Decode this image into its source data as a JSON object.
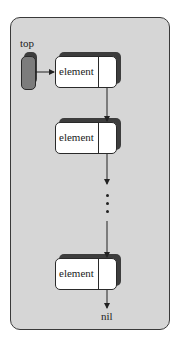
{
  "diagram": {
    "top_label": "top",
    "element_label": "element",
    "nodes": [
      {
        "label": "element"
      },
      {
        "label": "element"
      },
      {
        "label": "element"
      }
    ],
    "terminal_label": "nil",
    "ellipsis": "..."
  },
  "colors": {
    "panel": "#d6d6d6",
    "top_pointer": "#7c7c7c",
    "shadow": "#3d3d3d",
    "node_fill": "#ffffff"
  }
}
